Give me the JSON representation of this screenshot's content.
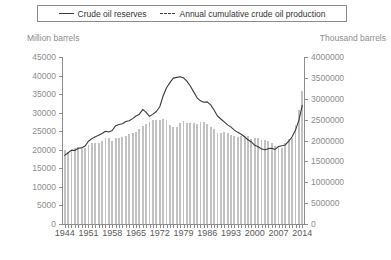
{
  "legend": {
    "entries": [
      {
        "label": "Crude oil reserves",
        "style": "solid",
        "icon": "line-solid-icon"
      },
      {
        "label": "Annual cumulative crude oil production",
        "style": "dashed",
        "icon": "line-dashed-icon"
      }
    ]
  },
  "axes": {
    "left_unit": "Million barrels",
    "right_unit": "Thousand barrels",
    "left_ticks": [
      0,
      5000,
      10000,
      15000,
      20000,
      25000,
      30000,
      35000,
      40000,
      45000
    ],
    "right_ticks": [
      0,
      500000,
      1000000,
      1500000,
      2000000,
      2500000,
      3000000,
      3500000,
      4000000
    ],
    "x_ticks": [
      1944,
      1951,
      1958,
      1965,
      1972,
      1979,
      1986,
      1993,
      2000,
      2007,
      2014
    ]
  },
  "colors": {
    "bar": "#c2c2c2",
    "line": "#3a3a3a",
    "axis": "#8d8d8d",
    "tick_label": "#8d8d8d",
    "xlabel": "#5a5a5a",
    "background": "#ffffff"
  },
  "chart_data": {
    "type": "bar",
    "title": "",
    "subtitle": "",
    "xlabel": "",
    "ylabel": "Million barrels",
    "y2label": "Thousand barrels",
    "ylim": [
      0,
      45000
    ],
    "y2lim": [
      0,
      4000000
    ],
    "xlim": [
      1944,
      2014
    ],
    "grid": false,
    "legend_position": "top",
    "x": [
      1944,
      1945,
      1946,
      1947,
      1948,
      1949,
      1950,
      1951,
      1952,
      1953,
      1954,
      1955,
      1956,
      1957,
      1958,
      1959,
      1960,
      1961,
      1962,
      1963,
      1964,
      1965,
      1966,
      1967,
      1968,
      1969,
      1970,
      1971,
      1972,
      1973,
      1974,
      1975,
      1976,
      1977,
      1978,
      1979,
      1980,
      1981,
      1982,
      1983,
      1984,
      1985,
      1986,
      1987,
      1988,
      1989,
      1990,
      1991,
      1992,
      1993,
      1994,
      1995,
      1996,
      1997,
      1998,
      1999,
      2000,
      2001,
      2002,
      2003,
      2004,
      2005,
      2006,
      2007,
      2008,
      2009,
      2010,
      2011,
      2012,
      2013,
      2014
    ],
    "series": [
      {
        "name": "Crude oil reserves",
        "axis": "left",
        "unit": "Million barrels",
        "render": "line",
        "style": "solid",
        "values": [
          18500,
          19200,
          19900,
          19800,
          20400,
          20500,
          21000,
          22300,
          23000,
          23500,
          23900,
          24400,
          25000,
          24800,
          25200,
          26500,
          26800,
          27000,
          27600,
          27800,
          28400,
          29100,
          29600,
          30900,
          30100,
          29000,
          29600,
          30300,
          31600,
          34500,
          36700,
          38100,
          39300,
          39500,
          39700,
          39400,
          38500,
          37200,
          35600,
          34000,
          33200,
          32800,
          32900,
          32100,
          30700,
          29100,
          28300,
          27500,
          26700,
          26100,
          25300,
          24700,
          24200,
          23500,
          22700,
          22100,
          21200,
          20800,
          20200,
          20000,
          20300,
          20400,
          20100,
          20900,
          21100,
          21300,
          22300,
          23500,
          25300,
          28000,
          32000
        ]
      },
      {
        "name": "Annual cumulative crude oil production",
        "axis": "right",
        "unit": "Thousand barrels",
        "render": "bar",
        "style": "dashed",
        "values": [
          1780000,
          1730000,
          1760000,
          1810000,
          1850000,
          1790000,
          1830000,
          1900000,
          1930000,
          1950000,
          1930000,
          2000000,
          2050000,
          2060000,
          1980000,
          2050000,
          2060000,
          2080000,
          2120000,
          2150000,
          2180000,
          2210000,
          2270000,
          2350000,
          2400000,
          2440000,
          2480000,
          2480000,
          2500000,
          2520000,
          2480000,
          2380000,
          2320000,
          2320000,
          2420000,
          2470000,
          2430000,
          2420000,
          2420000,
          2400000,
          2450000,
          2440000,
          2400000,
          2320000,
          2270000,
          2190000,
          2190000,
          2200000,
          2170000,
          2130000,
          2110000,
          2080000,
          2110000,
          2120000,
          2110000,
          2030000,
          2060000,
          2050000,
          2020000,
          2020000,
          1980000,
          1930000,
          1880000,
          1860000,
          1830000,
          1950000,
          2030000,
          2070000,
          2380000,
          2720000,
          3190000
        ]
      }
    ]
  }
}
